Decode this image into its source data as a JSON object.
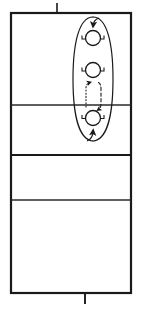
{
  "figure": {
    "type": "technical-line-drawing",
    "title": "",
    "background_color": "#ffffff",
    "line_color": "#1a1a1a",
    "canvas": {
      "width": 142,
      "height": 311
    },
    "enclosure": {
      "name": "outer-rectangle",
      "x": 11,
      "y": 13,
      "width": 120,
      "height": 280,
      "stroke_width": 2.2
    },
    "horizontal_dividers": [
      {
        "name": "divider-1",
        "y": 105,
        "x1": 11,
        "x2": 131,
        "stroke_width": 1.4
      },
      {
        "name": "divider-2",
        "y": 155,
        "x1": 11,
        "x2": 131,
        "stroke_width": 2.0
      },
      {
        "name": "divider-3",
        "y": 200,
        "x1": 11,
        "x2": 131,
        "stroke_width": 1.4
      }
    ],
    "tick_marks": [
      {
        "name": "tick-top",
        "x": 57,
        "y1": 3,
        "y2": 14,
        "stroke_width": 1.6
      },
      {
        "name": "tick-bottom",
        "x": 85,
        "y1": 292,
        "y2": 303,
        "stroke_width": 1.8
      }
    ],
    "circulation_loop": {
      "name": "flow-ellipse",
      "cx": 93,
      "cy": 79,
      "rx": 20,
      "ry": 63,
      "stroke_width": 1.2,
      "style": "solid"
    },
    "nodes": [
      {
        "name": "node-top",
        "cx": 93,
        "cy": 38,
        "r": 7.5,
        "stroke_width": 1.3
      },
      {
        "name": "node-middle",
        "cx": 93,
        "cy": 70,
        "r": 7.5,
        "stroke_width": 1.3
      },
      {
        "name": "node-bottom",
        "cx": 93,
        "cy": 118,
        "r": 7.5,
        "stroke_width": 1.3
      }
    ],
    "node_brackets": {
      "name": "node-side-bracket",
      "offset_x": 10,
      "arm": 4,
      "stroke_width": 1.1
    },
    "flow_arrows": [
      {
        "name": "arrow-into-top-node",
        "direction": "down",
        "style": "solid",
        "at": [
          93,
          23
        ]
      },
      {
        "name": "arrow-into-bottom-node",
        "direction": "up",
        "style": "solid",
        "at": [
          93,
          131
        ]
      },
      {
        "name": "arrow-dotted-up",
        "direction": "up",
        "style": "dotted",
        "from": [
          86,
          105
        ],
        "to": [
          86,
          84
        ]
      },
      {
        "name": "arrow-dashed-down",
        "direction": "down",
        "style": "dashed",
        "from": [
          100,
          84
        ],
        "to": [
          100,
          108
        ]
      }
    ],
    "internal_link": {
      "name": "node-link-path",
      "style": "mixed",
      "description": "dotted ascending branch and dashed descending branch between middle and bottom nodes"
    }
  }
}
